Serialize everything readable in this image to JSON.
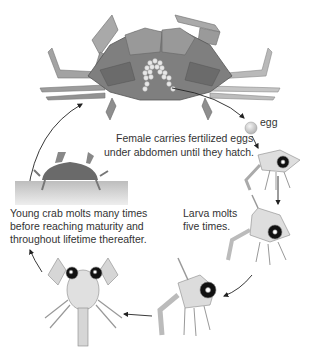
{
  "diagram": {
    "stages": [
      {
        "id": "adult-female",
        "caption_lines": [
          "Female carries fertilized eggs",
          "under abdomen until they hatch."
        ]
      },
      {
        "id": "egg",
        "caption_lines": [
          "egg"
        ]
      },
      {
        "id": "larva",
        "caption_lines": [
          "Larva molts",
          "five times."
        ]
      },
      {
        "id": "young-crab",
        "caption_lines": [
          "Young crab molts many times",
          "before reaching maturity and",
          "throughout lifetime thereafter."
        ]
      }
    ],
    "colors": {
      "adult": "#8a8a8a",
      "adult_dark": "#5e5e5e",
      "larva": "#d9d9d9",
      "ground": "#c8c8c8",
      "text": "#333333"
    }
  }
}
